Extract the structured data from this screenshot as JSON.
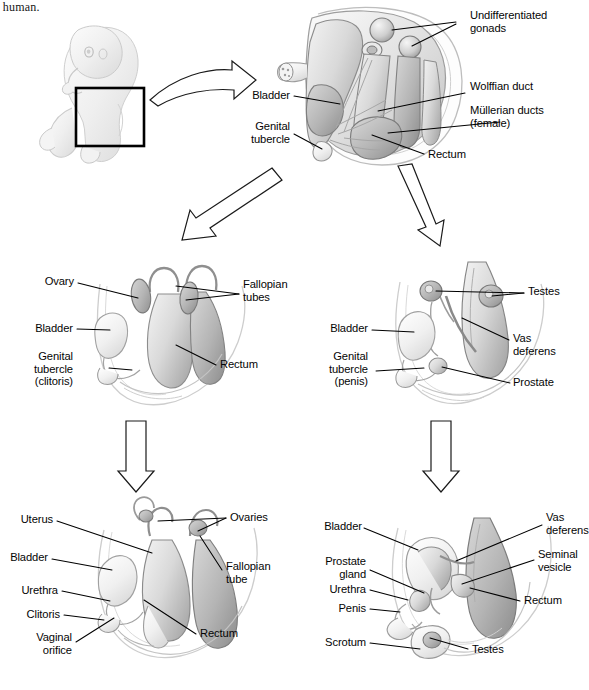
{
  "figure": {
    "caption_fragment": "e human.",
    "background": "#ffffff",
    "label_color": "#050505"
  },
  "panels": {
    "fetus": {
      "name": "fetus-illustration",
      "highlight_box": "pelvic-region"
    },
    "undifferentiated": {
      "name": "undifferentiated-stage",
      "labels": [
        {
          "id": "undifferentiated-gonads",
          "text": "Undifferentiated\ngonads",
          "align": "left"
        },
        {
          "id": "wolffian-duct",
          "text": "Wolffian duct",
          "align": "left"
        },
        {
          "id": "mullerian-ducts",
          "text": "Müllerian ducts\n(female)",
          "align": "left"
        },
        {
          "id": "rectum",
          "text": "Rectum",
          "align": "left"
        },
        {
          "id": "bladder",
          "text": "Bladder",
          "align": "right"
        },
        {
          "id": "genital-tubercle",
          "text": "Genital\ntubercle",
          "align": "right"
        }
      ]
    },
    "female_intermediate": {
      "name": "female-intermediate-stage",
      "labels": [
        {
          "id": "ovary",
          "text": "Ovary",
          "align": "right"
        },
        {
          "id": "bladder",
          "text": "Bladder",
          "align": "right"
        },
        {
          "id": "genital-tubercle-clitoris",
          "text": "Genital\ntubercle\n(clitoris)",
          "align": "right"
        },
        {
          "id": "fallopian-tubes",
          "text": "Fallopian\ntubes",
          "align": "left"
        },
        {
          "id": "rectum",
          "text": "Rectum",
          "align": "left"
        }
      ]
    },
    "male_intermediate": {
      "name": "male-intermediate-stage",
      "labels": [
        {
          "id": "bladder",
          "text": "Bladder",
          "align": "right"
        },
        {
          "id": "genital-tubercle-penis",
          "text": "Genital\ntubercle\n(penis)",
          "align": "right"
        },
        {
          "id": "testes",
          "text": "Testes",
          "align": "left"
        },
        {
          "id": "vas-deferens",
          "text": "Vas\ndeferens",
          "align": "left"
        },
        {
          "id": "prostate",
          "text": "Prostate",
          "align": "left"
        }
      ]
    },
    "female_mature": {
      "name": "female-mature-stage",
      "labels": [
        {
          "id": "uterus",
          "text": "Uterus",
          "align": "right"
        },
        {
          "id": "bladder",
          "text": "Bladder",
          "align": "right"
        },
        {
          "id": "urethra",
          "text": "Urethra",
          "align": "right"
        },
        {
          "id": "clitoris",
          "text": "Clitoris",
          "align": "right"
        },
        {
          "id": "vaginal-orifice",
          "text": "Vaginal\norifice",
          "align": "right"
        },
        {
          "id": "ovaries",
          "text": "Ovaries",
          "align": "left"
        },
        {
          "id": "fallopian-tube",
          "text": "Fallopian\ntube",
          "align": "left"
        },
        {
          "id": "rectum",
          "text": "Rectum",
          "align": "left"
        }
      ]
    },
    "male_mature": {
      "name": "male-mature-stage",
      "labels": [
        {
          "id": "bladder",
          "text": "Bladder",
          "align": "right"
        },
        {
          "id": "prostate-gland",
          "text": "Prostate\ngland",
          "align": "right"
        },
        {
          "id": "urethra",
          "text": "Urethra",
          "align": "right"
        },
        {
          "id": "penis",
          "text": "Penis",
          "align": "right"
        },
        {
          "id": "scrotum",
          "text": "Scrotum",
          "align": "right"
        },
        {
          "id": "vas-deferens",
          "text": "Vas\ndeferens",
          "align": "left"
        },
        {
          "id": "seminal-vesicle",
          "text": "Seminal\nvesicle",
          "align": "left"
        },
        {
          "id": "rectum",
          "text": "Rectum",
          "align": "left"
        },
        {
          "id": "testes",
          "text": "Testes",
          "align": "left"
        }
      ]
    }
  },
  "arrows": [
    {
      "id": "fetus-to-undifferentiated",
      "direction": "right-curved"
    },
    {
      "id": "undifferentiated-to-female",
      "direction": "down-left"
    },
    {
      "id": "undifferentiated-to-male",
      "direction": "down-right"
    },
    {
      "id": "female-intermediate-to-mature",
      "direction": "down"
    },
    {
      "id": "male-intermediate-to-mature",
      "direction": "down"
    }
  ]
}
